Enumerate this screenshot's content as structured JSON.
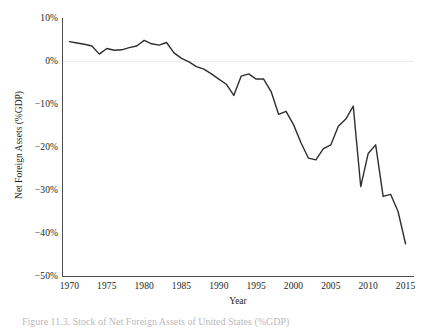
{
  "figure": {
    "caption": "Figure 11.3. Stock of Net Foreign Assets of United States (%GDP)"
  },
  "chart_data": {
    "type": "line",
    "title": "",
    "subtitle": "",
    "xlabel": "Year",
    "ylabel": "Net Foreign Assets (%GDP)",
    "xlim": [
      1969,
      2016
    ],
    "ylim": [
      -50,
      10
    ],
    "grid": false,
    "legend": null,
    "legend_position": "none",
    "line_color": "#2e2e2e",
    "zero_line_color": "#f0eeec",
    "axis_color": "#4c4c4c",
    "x_ticks": [
      1970,
      1975,
      1980,
      1985,
      1990,
      1995,
      2000,
      2005,
      2010,
      2015
    ],
    "x_tick_labels": [
      "1970",
      "1975",
      "1980",
      "1985",
      "1990",
      "1995",
      "2000",
      "2005",
      "2010",
      "2015"
    ],
    "y_ticks": [
      10,
      0,
      -10,
      -20,
      -30,
      -40,
      -50
    ],
    "y_tick_labels": [
      "10%",
      "0%",
      "−10%",
      "−20%",
      "−30%",
      "−40%",
      "−50%"
    ],
    "series": [
      {
        "name": "Net Foreign Assets (%GDP)",
        "x": [
          1970,
          1971,
          1972,
          1973,
          1974,
          1975,
          1976,
          1977,
          1978,
          1979,
          1980,
          1981,
          1982,
          1983,
          1984,
          1985,
          1986,
          1987,
          1988,
          1989,
          1990,
          1991,
          1992,
          1993,
          1994,
          1995,
          1996,
          1997,
          1998,
          1999,
          2000,
          2001,
          2002,
          2003,
          2004,
          2005,
          2006,
          2007,
          2008,
          2009,
          2010,
          2011,
          2012,
          2013,
          2014,
          2015
        ],
        "values": [
          4.5,
          4.2,
          3.9,
          3.5,
          1.6,
          2.9,
          2.5,
          2.6,
          3.1,
          3.5,
          4.8,
          4.0,
          3.7,
          4.3,
          1.9,
          0.6,
          -0.2,
          -1.3,
          -1.9,
          -3.0,
          -4.2,
          -5.4,
          -8.0,
          -3.5,
          -3.0,
          -4.2,
          -4.2,
          -7.1,
          -12.4,
          -11.7,
          -14.8,
          -19.0,
          -22.6,
          -23.0,
          -20.4,
          -19.5,
          -15.2,
          -13.5,
          -10.5,
          -29.2,
          -21.5,
          -19.5,
          -31.5,
          -31.0,
          -35.0,
          -42.5
        ]
      }
    ]
  }
}
